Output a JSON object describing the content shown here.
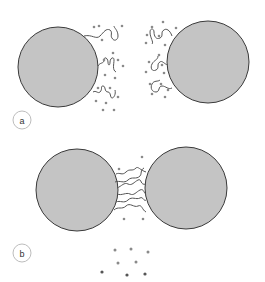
{
  "diagram": {
    "colors": {
      "particle_fill": "#c4c4c4",
      "particle_stroke": "#3a3a3a",
      "chain_stroke": "#555555",
      "dot_fill": "#8a8a8a",
      "dark_dot_fill": "#555555",
      "badge_stroke": "#bdbdbd"
    },
    "panels": [
      {
        "id": "a",
        "label": "a",
        "description": "Two separated particles with extended surface chains and bound small molecules"
      },
      {
        "id": "b",
        "label": "b",
        "description": "Particles approach; chains interpenetrate and small molecules are released"
      }
    ]
  }
}
